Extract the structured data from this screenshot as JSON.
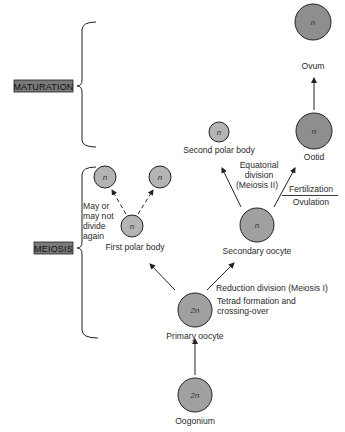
{
  "stages": {
    "maturation": "MATURATION",
    "meiosis": "MEIOSIS"
  },
  "cells": {
    "ovum": {
      "symbol": "n",
      "label": "Ovum"
    },
    "ootid": {
      "symbol": "n",
      "label": "Ootid"
    },
    "second_polar_body": {
      "symbol": "n",
      "label": "Second polar body"
    },
    "secondary_oocyte": {
      "symbol": "n",
      "label": "Secondary oocyte"
    },
    "first_polar_body": {
      "symbol": "n",
      "label": "First polar body"
    },
    "polar_daughter_left": {
      "symbol": "n"
    },
    "polar_daughter_right": {
      "symbol": "n"
    },
    "primary_oocyte": {
      "symbol": "2n",
      "label": "Primary oocyte"
    },
    "oogonium": {
      "symbol": "2n",
      "label": "Oogonium"
    }
  },
  "annotations": {
    "may_not_divide": [
      "May or",
      "may not",
      "divide",
      "again"
    ],
    "equatorial": [
      "Equatorial",
      "division",
      "(Meiosis II)"
    ],
    "fertilization": "Fertilization",
    "ovulation": "Ovulation",
    "reduction": "Reduction division (Meiosis I)",
    "tetrad": [
      "Tetrad formation and",
      "crossing-over"
    ]
  },
  "colors": {
    "large_cell_fill": "#8e8e8e",
    "small_cell_fill": "#b4b4b4",
    "stroke": "#2a2a2a",
    "stage_box_fill": "#7a7a7a"
  }
}
